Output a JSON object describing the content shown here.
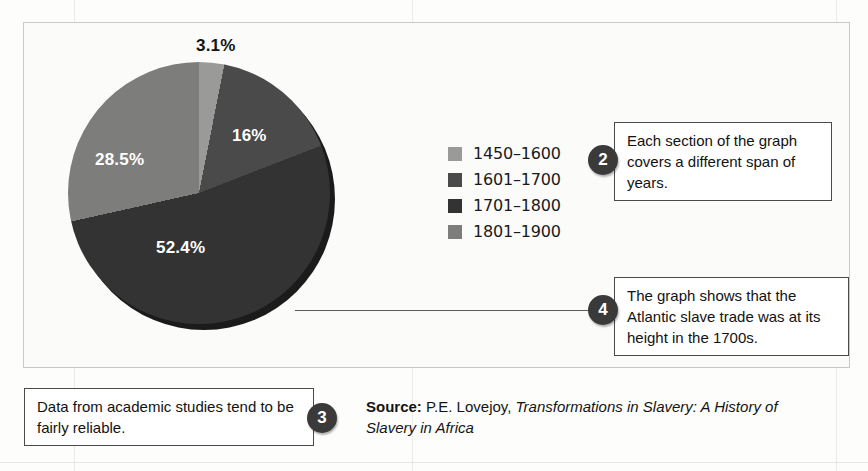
{
  "figure": {
    "frame_label": "pie-chart-frame",
    "source_prefix": "Source:",
    "source_author": " P.E. Lovejoy, ",
    "source_title": "Transformations in Slavery: A History of Slavery in Africa"
  },
  "chart_data": {
    "type": "pie",
    "title": "",
    "categories": [
      "1450–1600",
      "1601–1700",
      "1701–1800",
      "1801–1900"
    ],
    "values": [
      3.1,
      16.0,
      52.4,
      28.5
    ],
    "value_labels": [
      "3.1%",
      "16%",
      "52.4%",
      "28.5%"
    ],
    "colors": [
      "#9a9a98",
      "#4a4a4a",
      "#333333",
      "#7d7d7b"
    ],
    "legend_position": "right",
    "units": "percent",
    "grid": false,
    "start_angle_deg": 0,
    "direction": "clockwise"
  },
  "legend": {
    "items": [
      {
        "label": "1450–1600",
        "color": "#9a9a98"
      },
      {
        "label": "1601–1700",
        "color": "#4a4a4a"
      },
      {
        "label": "1701–1800",
        "color": "#333333"
      },
      {
        "label": "1801–1900",
        "color": "#7d7d7b"
      }
    ]
  },
  "callouts": [
    {
      "number": "2",
      "text": "Each section of the graph covers a different span of years."
    },
    {
      "number": "3",
      "text": "Data from academic studies tend to be fairly reliable."
    },
    {
      "number": "4",
      "text": "The graph shows that the Atlantic slave trade was at its height in the 1700s."
    }
  ],
  "ghost_text": {
    "a": "ter and Country Walks",
    "b": "Africa and the",
    "c": "slave trade",
    "d": "history"
  }
}
